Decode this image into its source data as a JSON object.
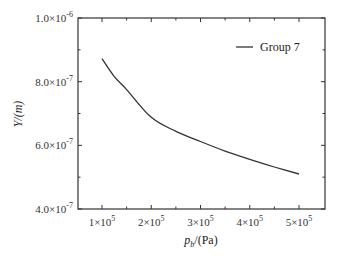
{
  "chart_data": {
    "type": "line",
    "title": "",
    "xlabel_main": "p",
    "xlabel_sub": "b",
    "xlabel_unit": "/(Pa)",
    "xlabel": "p_b/(Pa)",
    "ylabel": "Y/(m)",
    "xlim": [
      50000,
      550000
    ],
    "ylim": [
      4e-07,
      1e-06
    ],
    "grid": false,
    "legend_position": "upper right",
    "x_ticks": [
      {
        "value": 100000,
        "mantissa": "1",
        "exp": "5"
      },
      {
        "value": 200000,
        "mantissa": "2",
        "exp": "5"
      },
      {
        "value": 300000,
        "mantissa": "3",
        "exp": "5"
      },
      {
        "value": 400000,
        "mantissa": "4",
        "exp": "5"
      },
      {
        "value": 500000,
        "mantissa": "5",
        "exp": "5"
      }
    ],
    "y_ticks": [
      {
        "value": 4e-07,
        "mantissa": "4.0",
        "exp": "-7"
      },
      {
        "value": 6e-07,
        "mantissa": "6.0",
        "exp": "-7"
      },
      {
        "value": 8e-07,
        "mantissa": "8.0",
        "exp": "-7"
      },
      {
        "value": 1e-06,
        "mantissa": "1.0",
        "exp": "-6"
      }
    ],
    "series": [
      {
        "name": "Group 7",
        "color": "#333333",
        "x": [
          100000,
          125000,
          150000,
          200000,
          250000,
          300000,
          350000,
          400000,
          450000,
          500000
        ],
        "values": [
          8.72e-07,
          8.16e-07,
          7.75e-07,
          6.88e-07,
          6.44e-07,
          6.12e-07,
          5.82e-07,
          5.56e-07,
          5.32e-07,
          5.1e-07
        ]
      }
    ]
  }
}
